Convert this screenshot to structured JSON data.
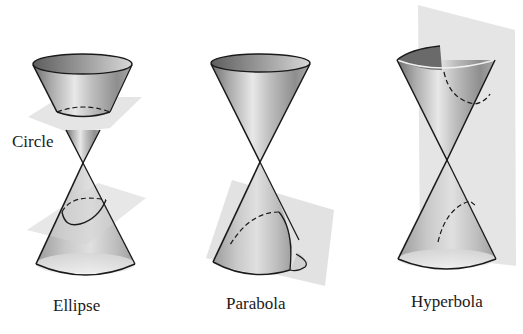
{
  "figure": {
    "panels": [
      {
        "id": "ellipse",
        "caption": "Ellipse",
        "inline_label": "Circle",
        "description": "Double cone cut by two planes: a horizontal plane producing a circle on the upper nappe and a tilted plane producing an ellipse on the lower nappe"
      },
      {
        "id": "parabola",
        "caption": "Parabola",
        "description": "Double cone cut by a plane parallel to a generator line, producing a parabola on the lower nappe"
      },
      {
        "id": "hyperbola",
        "caption": "Hyperbola",
        "description": "Double cone cut by a vertical plane intersecting both nappes, producing a two-branch hyperbola"
      }
    ]
  },
  "colors": {
    "background": "#ffffff",
    "cone_light": "#e6e6e6",
    "cone_mid": "#b8b8b8",
    "cone_dark": "#7a7a7a",
    "plane": "#d9d9d9",
    "outline": "#1a1a1a"
  }
}
